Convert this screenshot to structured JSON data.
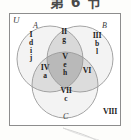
{
  "figure": {
    "title_fragment": "第 6 节",
    "universe_label": "U",
    "outside_region": "VIII",
    "sets": [
      {
        "id": "A",
        "label": "A"
      },
      {
        "id": "B",
        "label": "B"
      },
      {
        "id": "C",
        "label": "C"
      }
    ],
    "regions": [
      {
        "id": "I",
        "numeral": "I",
        "members": [
          "d",
          "i",
          "j"
        ]
      },
      {
        "id": "II",
        "numeral": "II",
        "members": [
          "g"
        ]
      },
      {
        "id": "III",
        "numeral": "III",
        "members": [
          "b",
          "l"
        ]
      },
      {
        "id": "IV",
        "numeral": "IV",
        "members": [
          "a"
        ]
      },
      {
        "id": "V",
        "numeral": "V",
        "members": [
          "e",
          "h"
        ]
      },
      {
        "id": "VI",
        "numeral": "VI",
        "members": []
      },
      {
        "id": "VII",
        "numeral": "VII",
        "members": [
          "c"
        ]
      },
      {
        "id": "VIII",
        "numeral": "VIII",
        "members": []
      }
    ],
    "region_text": {
      "I_numeral": "I",
      "I_m1": "d",
      "I_m2": "i",
      "I_m3": "j",
      "II_numeral": "II",
      "II_m1": "g",
      "III_numeral": "III",
      "III_m1": "b",
      "III_m2": "l",
      "IV_numeral": "IV",
      "IV_m1": "a",
      "V_numeral": "V",
      "V_m1": "e",
      "V_m2": "h",
      "VI_numeral": "VI",
      "VII_numeral": "VII",
      "VII_m1": "c",
      "VIII_numeral": "VIII"
    },
    "colors": {
      "circle_stroke": "#9a9a9a",
      "box_stroke": "#8d8d8d",
      "background": "#ffffff",
      "fill_pair": "#d8d8d8",
      "fill_triple": "#b9b9b9",
      "fill_single": "#f2f2f2",
      "text": "#1e1e1e"
    }
  }
}
